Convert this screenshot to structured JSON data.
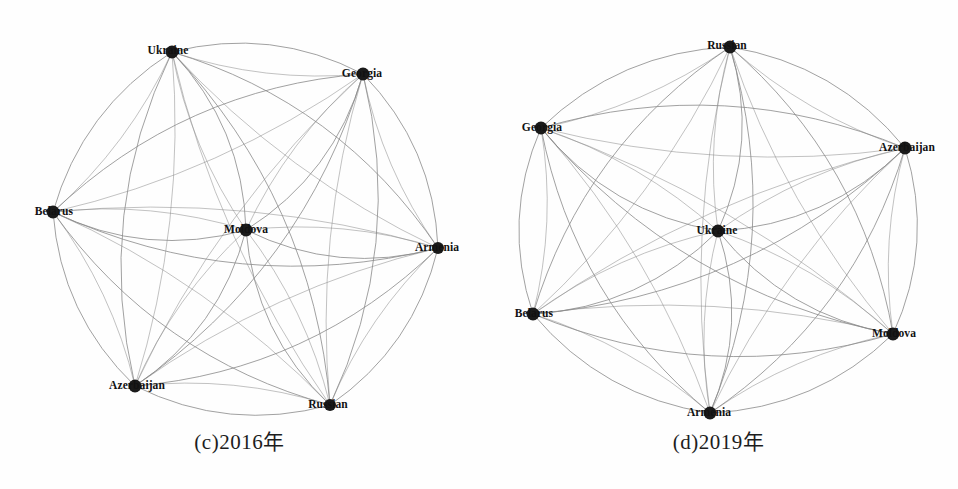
{
  "figure": {
    "background": "#fefefe",
    "edge_color": "#8a8a8a",
    "node_color": "#1a1a1a",
    "label_color": "#111111"
  },
  "chart_data": {
    "type": "graph",
    "title": "",
    "panels": [
      {
        "id": "c",
        "caption": "(c)2016年",
        "year": "2016年",
        "layout": "circular-with-center",
        "center": [
          239,
          215
        ],
        "radius": 195,
        "nodes": [
          {
            "id": "ukraine",
            "label": "Ukraine",
            "x": 172,
            "y": 52,
            "r": 6.5,
            "label_x": 168,
            "label_y": 50,
            "degree": 7
          },
          {
            "id": "georgia",
            "label": "Georgia",
            "x": 363,
            "y": 74,
            "r": 6.5,
            "label_x": 362,
            "label_y": 73,
            "degree": 7
          },
          {
            "id": "armenia",
            "label": "Armenia",
            "x": 438,
            "y": 248,
            "r": 6.0,
            "label_x": 437,
            "label_y": 247,
            "degree": 7
          },
          {
            "id": "russian",
            "label": "Russian",
            "x": 330,
            "y": 405,
            "r": 6.0,
            "label_x": 328,
            "label_y": 404,
            "degree": 7
          },
          {
            "id": "azerbaijan",
            "label": "Azerbaijan",
            "x": 135,
            "y": 386,
            "r": 6.5,
            "label_x": 137,
            "label_y": 385,
            "degree": 7
          },
          {
            "id": "belarus",
            "label": "Belarus",
            "x": 53,
            "y": 212,
            "r": 6.5,
            "label_x": 54,
            "label_y": 211,
            "degree": 7
          },
          {
            "id": "moldova",
            "label": "Moldova",
            "x": 246,
            "y": 230,
            "r": 6.5,
            "label_x": 246,
            "label_y": 229,
            "degree": 7
          }
        ],
        "edges": [
          [
            "ukraine",
            "georgia"
          ],
          [
            "ukraine",
            "armenia"
          ],
          [
            "ukraine",
            "russian"
          ],
          [
            "ukraine",
            "azerbaijan"
          ],
          [
            "ukraine",
            "belarus"
          ],
          [
            "ukraine",
            "moldova"
          ],
          [
            "georgia",
            "armenia"
          ],
          [
            "georgia",
            "russian"
          ],
          [
            "georgia",
            "azerbaijan"
          ],
          [
            "georgia",
            "belarus"
          ],
          [
            "georgia",
            "moldova"
          ],
          [
            "armenia",
            "russian"
          ],
          [
            "armenia",
            "azerbaijan"
          ],
          [
            "armenia",
            "belarus"
          ],
          [
            "armenia",
            "moldova"
          ],
          [
            "russian",
            "azerbaijan"
          ],
          [
            "russian",
            "belarus"
          ],
          [
            "russian",
            "moldova"
          ],
          [
            "azerbaijan",
            "belarus"
          ],
          [
            "azerbaijan",
            "moldova"
          ],
          [
            "belarus",
            "moldova"
          ]
        ]
      },
      {
        "id": "d",
        "caption": "(d)2019年",
        "year": "2019年",
        "layout": "circular-with-center",
        "center": [
          239,
          230
        ],
        "radius": 190,
        "nodes": [
          {
            "id": "russian",
            "label": "Russian",
            "x": 251,
            "y": 47,
            "r": 6.5,
            "label_x": 248,
            "label_y": 45,
            "degree": 7
          },
          {
            "id": "azerbaijan",
            "label": "Azerbaijan",
            "x": 426,
            "y": 148,
            "r": 6.5,
            "label_x": 428,
            "label_y": 147,
            "degree": 7
          },
          {
            "id": "moldova",
            "label": "Moldova",
            "x": 414,
            "y": 334,
            "r": 6.5,
            "label_x": 415,
            "label_y": 333,
            "degree": 7
          },
          {
            "id": "armenia",
            "label": "Armenia",
            "x": 231,
            "y": 413,
            "r": 6.5,
            "label_x": 230,
            "label_y": 412,
            "degree": 7
          },
          {
            "id": "belarus",
            "label": "Belarus",
            "x": 54,
            "y": 314,
            "r": 6.5,
            "label_x": 55,
            "label_y": 313,
            "degree": 7
          },
          {
            "id": "georgia",
            "label": "Georgia",
            "x": 62,
            "y": 128,
            "r": 6.5,
            "label_x": 63,
            "label_y": 127,
            "degree": 7
          },
          {
            "id": "ukraine",
            "label": "Ukraine",
            "x": 239,
            "y": 231,
            "r": 6.5,
            "label_x": 238,
            "label_y": 230,
            "degree": 7
          }
        ],
        "edges": [
          [
            "russian",
            "azerbaijan"
          ],
          [
            "russian",
            "moldova"
          ],
          [
            "russian",
            "armenia"
          ],
          [
            "russian",
            "belarus"
          ],
          [
            "russian",
            "georgia"
          ],
          [
            "russian",
            "ukraine"
          ],
          [
            "azerbaijan",
            "moldova"
          ],
          [
            "azerbaijan",
            "armenia"
          ],
          [
            "azerbaijan",
            "belarus"
          ],
          [
            "azerbaijan",
            "georgia"
          ],
          [
            "azerbaijan",
            "ukraine"
          ],
          [
            "moldova",
            "armenia"
          ],
          [
            "moldova",
            "belarus"
          ],
          [
            "moldova",
            "georgia"
          ],
          [
            "moldova",
            "ukraine"
          ],
          [
            "armenia",
            "belarus"
          ],
          [
            "armenia",
            "georgia"
          ],
          [
            "armenia",
            "ukraine"
          ],
          [
            "belarus",
            "georgia"
          ],
          [
            "belarus",
            "ukraine"
          ],
          [
            "georgia",
            "ukraine"
          ]
        ]
      }
    ]
  }
}
